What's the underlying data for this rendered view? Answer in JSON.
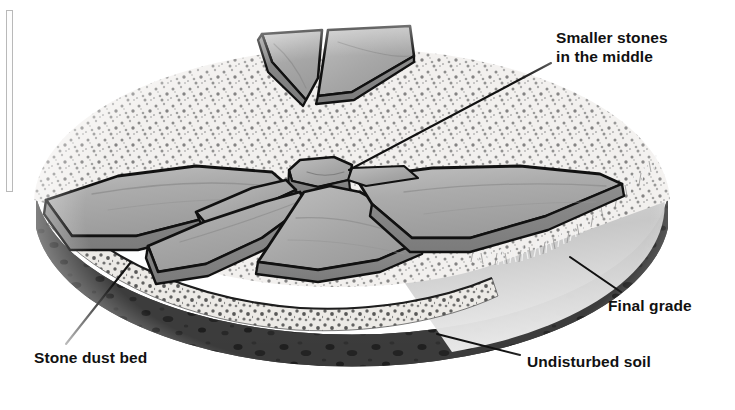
{
  "figure": {
    "canvas": {
      "width": 735,
      "height": 410,
      "background": "#ffffff"
    }
  },
  "labels": [
    {
      "id": "smaller-stones",
      "text": "Smaller stones\nin the middle",
      "x": 556,
      "y": 28,
      "leader": {
        "from": [
          551,
          63
        ],
        "to": [
          349,
          170
        ]
      }
    },
    {
      "id": "final-grade",
      "text": "Final grade",
      "x": 608,
      "y": 296,
      "leader": {
        "from": [
          619,
          292
        ],
        "to": [
          571,
          258
        ]
      }
    },
    {
      "id": "stone-dust-bed",
      "text": "Stone dust bed",
      "x": 34,
      "y": 348,
      "leader": {
        "from": [
          66,
          344
        ],
        "to": [
          131,
          262
        ]
      }
    },
    {
      "id": "undisturbed-soil",
      "text": "Undisturbed soil",
      "x": 527,
      "y": 352,
      "leader": {
        "from": [
          520,
          355
        ],
        "to": [
          437,
          334
        ]
      }
    }
  ],
  "layers": [
    {
      "name": "stone-dust-bed",
      "color": "#ebe9e6",
      "speckle": "#6b6b6b"
    },
    {
      "name": "undisturbed-soil",
      "color": "#3a3a3a",
      "speckle": "#1e1e1e"
    },
    {
      "name": "lawn-final-grade",
      "color": "#c9c9c9"
    }
  ],
  "colors": {
    "stone_top": "#a9a9a9",
    "stone_top_light": "#bcbcbc",
    "stone_edge": "#8a8a8a",
    "stone_side": "#9a9a9a",
    "outline": "#111111",
    "dust": "#edebe8",
    "soil": "#3a3a3a",
    "grass": "#d0d0d0",
    "label_text": "#111111"
  },
  "stones": {
    "count_visible": 7,
    "center_stone": "small hexagonal keystone",
    "arrangement": "radial wedges around a small central stone"
  },
  "artifacts": {
    "left_scan_bar": {
      "x": 6,
      "y": 10,
      "width": 7,
      "height": 182
    }
  }
}
